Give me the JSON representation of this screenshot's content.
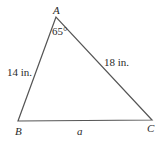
{
  "diagram": {
    "type": "triangle",
    "vertices": {
      "A": {
        "label": "A",
        "x": 56,
        "y": 17
      },
      "B": {
        "label": "B",
        "x": 18,
        "y": 121
      },
      "C": {
        "label": "C",
        "x": 152,
        "y": 120
      }
    },
    "angle_A": "65°",
    "side_AB": "14 in.",
    "side_AC": "18 in.",
    "side_BC": "a",
    "stroke_color": "#555555"
  }
}
